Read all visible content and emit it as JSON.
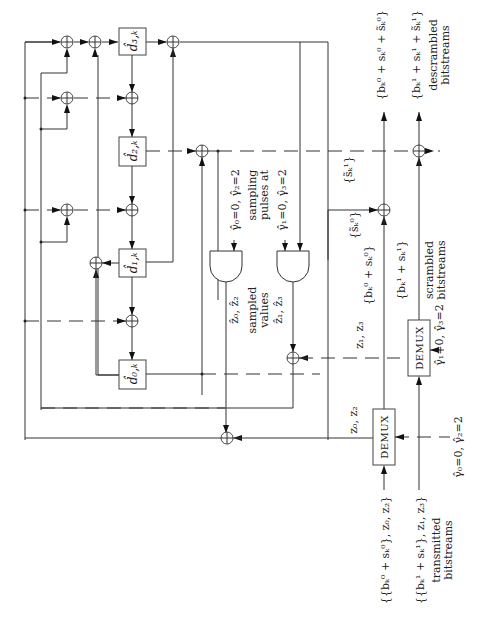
{
  "figure": {
    "orientation": "rotated-90-ccw",
    "registers": [
      {
        "id": "d3",
        "label": "d̂₃,ₖ"
      },
      {
        "id": "d2",
        "label": "d̂₂,ₖ"
      },
      {
        "id": "d1",
        "label": "d̂₁,ₖ"
      },
      {
        "id": "d0",
        "label": "d̂₀,ₖ"
      }
    ],
    "demux": [
      {
        "id": "demux-0",
        "label": "DEMUX",
        "control": "γ̂₀=0, γ̂₂=2",
        "output_label": "z₀, z₂"
      },
      {
        "id": "demux-1",
        "label": "DEMUX",
        "control": "γ̂₁=0, γ̂₃=2",
        "output_label": "z₁, z₃"
      }
    ],
    "gates": {
      "gate-0": {
        "control": "γ̂₀=0, γ̂₂=2",
        "output": "ẑ₀, ẑ₂"
      },
      "gate-1": {
        "control": "γ̂₁=0, γ̂₃=2",
        "output": "ẑ₁, ẑ₃"
      }
    },
    "labels": {
      "sampling_pulses_line1": "sampling",
      "sampling_pulses_line2": "pulses at",
      "sampled_values_line1": "sampled",
      "sampled_values_line2": "values",
      "s0_estimate": "{s̃ₖ⁰}",
      "s1_estimate": "{s̃ₖ¹}",
      "scrambled_0": "{bₖ⁰ + sₖ⁰}",
      "scrambled_1": "{bₖ¹ + sₖ¹}",
      "scrambled_caption_1": "scrambled",
      "scrambled_caption_2": "bitstreams",
      "descrambled_0": "{bₖ⁰ + sₖ⁰ + s̃ₖ⁰}",
      "descrambled_1": "{bₖ¹ + sₖ¹ + s̃ₖ¹}",
      "descrambled_caption_1": "descrambled",
      "descrambled_caption_2": "bitstreams",
      "transmitted_0": "{{bₖ⁰ + sₖ⁰}, z₀, z₂}",
      "transmitted_1": "{{bₖ¹ + sₖ¹}, z₁, z₃}",
      "transmitted_caption_1": "transmitted",
      "transmitted_caption_2": "bitstreams"
    }
  }
}
